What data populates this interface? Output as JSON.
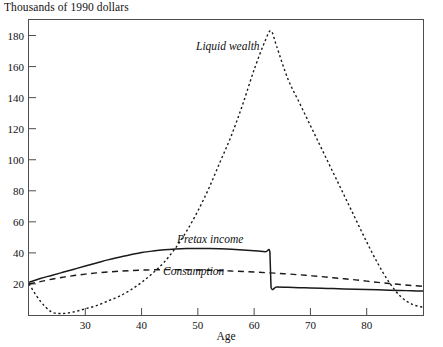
{
  "figure": {
    "y_axis_caption": "Thousands of 1990 dollars",
    "x_axis_title": "Age"
  },
  "labels": {
    "liquid_wealth": "Liquid wealth",
    "pretax_income": "Pretax income",
    "consumption": "Consumption"
  },
  "ticks": {
    "y": [
      "20",
      "40",
      "60",
      "80",
      "100",
      "120",
      "140",
      "160",
      "180"
    ],
    "x": [
      "30",
      "40",
      "50",
      "60",
      "70",
      "80"
    ]
  },
  "chart_data": {
    "type": "line",
    "title": "",
    "subtitle": "",
    "xlabel": "Age",
    "ylabel": "Thousands of 1990 dollars",
    "xlim": [
      20,
      90
    ],
    "ylim": [
      0,
      190
    ],
    "xticks": [
      30,
      40,
      50,
      60,
      70,
      80
    ],
    "yticks": [
      20,
      40,
      60,
      80,
      100,
      120,
      140,
      160,
      180
    ],
    "grid": false,
    "legend": "inline-annotations",
    "annotations": [
      {
        "text": "Liquid wealth",
        "x": 49,
        "y": 172,
        "style": "italic"
      },
      {
        "text": "Pretax income",
        "x": 52,
        "y": 49,
        "style": "italic"
      },
      {
        "text": "Consumption",
        "x": 47,
        "y": 28,
        "style": "italic"
      }
    ],
    "series": [
      {
        "name": "Liquid wealth",
        "line_style": "dotted",
        "x": [
          20,
          22,
          24,
          26,
          28,
          30,
          32,
          34,
          36,
          38,
          40,
          42,
          44,
          46,
          48,
          50,
          52,
          54,
          56,
          58,
          60,
          62,
          63,
          64,
          66,
          68,
          70,
          72,
          74,
          76,
          78,
          80,
          82,
          84,
          86,
          88,
          90
        ],
        "y": [
          20,
          9,
          2,
          1,
          2,
          4,
          6,
          9,
          12,
          16,
          21,
          27,
          34,
          43,
          54,
          67,
          82,
          99,
          116,
          136,
          158,
          177,
          183,
          173,
          152,
          137,
          122,
          107,
          92,
          77,
          62,
          47,
          33,
          21,
          12,
          7,
          5
        ]
      },
      {
        "name": "Pretax income",
        "line_style": "solid",
        "x": [
          20,
          22,
          24,
          26,
          28,
          30,
          32,
          34,
          36,
          38,
          40,
          42,
          44,
          46,
          48,
          50,
          52,
          54,
          56,
          58,
          60,
          62,
          62.8,
          63,
          64,
          66,
          68,
          70,
          72,
          74,
          76,
          78,
          80,
          82,
          84,
          86,
          88,
          90
        ],
        "y": [
          21,
          23.5,
          25.5,
          27.5,
          29.5,
          31.5,
          33.5,
          35.5,
          37.2,
          38.8,
          40.2,
          41.2,
          42.0,
          42.5,
          42.8,
          42.9,
          42.8,
          42.6,
          42.3,
          41.9,
          41.4,
          40.8,
          40.5,
          18.0,
          18.0,
          17.8,
          17.6,
          17.4,
          17.2,
          17.0,
          16.8,
          16.6,
          16.4,
          16.2,
          16.0,
          15.8,
          15.6,
          15.4
        ]
      },
      {
        "name": "Consumption",
        "line_style": "dashed",
        "x": [
          20,
          22,
          24,
          26,
          28,
          30,
          32,
          34,
          36,
          38,
          40,
          42,
          44,
          46,
          48,
          50,
          52,
          54,
          56,
          58,
          60,
          62,
          64,
          66,
          68,
          70,
          72,
          74,
          76,
          78,
          80,
          82,
          84,
          86,
          88,
          90
        ],
        "y": [
          20,
          21.5,
          23.0,
          24.3,
          25.4,
          26.3,
          27.1,
          27.7,
          28.2,
          28.6,
          28.9,
          29.1,
          29.2,
          29.2,
          29.1,
          29.0,
          28.8,
          28.6,
          28.3,
          28.0,
          27.7,
          27.3,
          26.9,
          26.4,
          25.9,
          25.3,
          24.7,
          24.0,
          23.3,
          22.6,
          21.8,
          21.0,
          20.3,
          19.6,
          19.0,
          18.5
        ]
      }
    ]
  }
}
